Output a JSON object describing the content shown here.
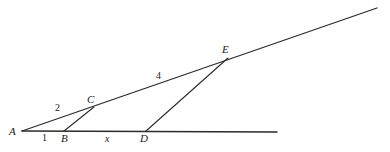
{
  "diagram": {
    "background_color": "#ffffff",
    "line_color": "#2b2b2b",
    "label_color": "#1a1a1a",
    "width": 390,
    "height": 152,
    "points": [
      {
        "id": "A",
        "label": "A",
        "x": 22,
        "y": 131,
        "label_x": 9,
        "label_y": 126
      },
      {
        "id": "B",
        "label": "B",
        "x": 64,
        "y": 131,
        "label_x": 61,
        "label_y": 133
      },
      {
        "id": "C",
        "label": "C",
        "x": 94,
        "y": 107,
        "label_x": 87,
        "label_y": 94
      },
      {
        "id": "D",
        "label": "D",
        "x": 146,
        "y": 131,
        "label_x": 140,
        "label_y": 133
      },
      {
        "id": "E",
        "label": "E",
        "x": 228,
        "y": 58,
        "label_x": 222,
        "label_y": 44
      }
    ],
    "segments": [
      {
        "id": "baseline",
        "name": "ray-A-through-B-D",
        "x1": 22,
        "y1": 131,
        "x2": 277,
        "y2": 132,
        "width": 1.6
      },
      {
        "id": "upper-ray",
        "name": "ray-A-through-C-E",
        "x1": 22,
        "y1": 131,
        "x2": 377,
        "y2": 8,
        "width": 1.3
      },
      {
        "id": "bc",
        "name": "segment-B-C",
        "x1": 64,
        "y1": 131,
        "x2": 94,
        "y2": 107,
        "width": 1.1
      },
      {
        "id": "de",
        "name": "segment-D-E",
        "x1": 146,
        "y1": 131,
        "x2": 228,
        "y2": 58,
        "width": 1.1
      }
    ],
    "measures": [
      {
        "id": "m1",
        "text": "1",
        "x": 42,
        "y": 133,
        "italic": false,
        "describes": "length-A-B"
      },
      {
        "id": "m2",
        "text": "2",
        "x": 55,
        "y": 103,
        "italic": false,
        "describes": "length-A-C"
      },
      {
        "id": "mx",
        "text": "x",
        "x": 105,
        "y": 134,
        "italic": true,
        "describes": "length-B-D"
      },
      {
        "id": "m4",
        "text": "4",
        "x": 156,
        "y": 71,
        "italic": false,
        "describes": "length-C-E"
      }
    ]
  }
}
